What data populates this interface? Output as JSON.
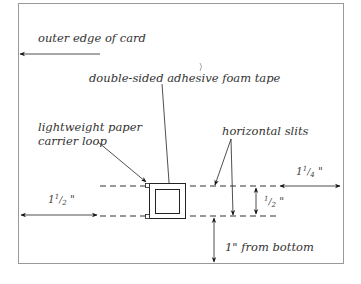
{
  "diagram": {
    "labels": {
      "outer_edge": "outer edge of card",
      "foam_tape": "double-sided adhesive foam tape",
      "carrier_loop_line1": "lightweight paper",
      "carrier_loop_line2": "carrier loop",
      "horizontal_slits": "horizontal slits",
      "from_bottom": "1\" from bottom"
    },
    "dimensions": {
      "left_whole": "1",
      "left_num": "1",
      "left_den": "2",
      "left_unit": "\"",
      "right_whole": "1",
      "right_num": "1",
      "right_den": "4",
      "right_unit": "\"",
      "gap_num": "1",
      "gap_den": "2",
      "gap_unit": "\""
    },
    "colors": {
      "line": "#222222",
      "border": "#888888",
      "text": "#333333"
    }
  }
}
